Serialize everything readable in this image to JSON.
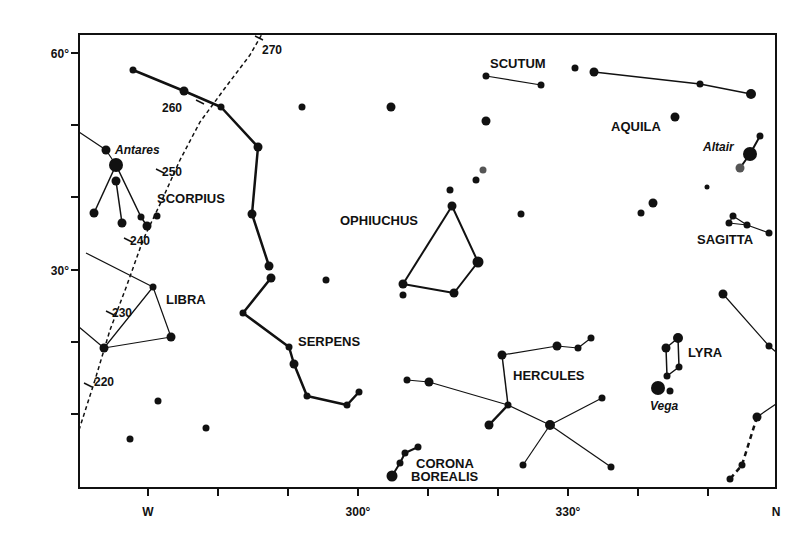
{
  "chart_data": {
    "type": "scatter",
    "title": "",
    "frame": {
      "x0": 79,
      "y0": 34,
      "x1": 776,
      "y1": 488
    },
    "y_axis": {
      "ticks": [
        {
          "y": 53,
          "label": "60°"
        },
        {
          "y": 125,
          "label": ""
        },
        {
          "y": 197,
          "label": ""
        },
        {
          "y": 270,
          "label": "30°"
        },
        {
          "y": 342,
          "label": ""
        },
        {
          "y": 414,
          "label": ""
        }
      ]
    },
    "x_axis": {
      "ticks": [
        {
          "x": 148,
          "label": "W"
        },
        {
          "x": 218,
          "label": ""
        },
        {
          "x": 288,
          "label": ""
        },
        {
          "x": 358,
          "label": "300°"
        },
        {
          "x": 428,
          "label": ""
        },
        {
          "x": 498,
          "label": ""
        },
        {
          "x": 568,
          "label": "330°"
        },
        {
          "x": 638,
          "label": ""
        },
        {
          "x": 708,
          "label": ""
        },
        {
          "x": 776,
          "label": "N"
        }
      ]
    },
    "ecliptic": {
      "style": "dashed",
      "path": [
        [
          79,
          430
        ],
        [
          95,
          380
        ],
        [
          110,
          330
        ],
        [
          127,
          285
        ],
        [
          143,
          240
        ],
        [
          162,
          200
        ],
        [
          180,
          160
        ],
        [
          200,
          122
        ],
        [
          225,
          88
        ],
        [
          250,
          55
        ],
        [
          262,
          34
        ]
      ],
      "marks": [
        {
          "label": "220",
          "x": 88,
          "y": 385,
          "lx": 94,
          "ly": 386
        },
        {
          "label": "230",
          "x": 110,
          "y": 313,
          "lx": 112,
          "ly": 317
        },
        {
          "label": "240",
          "x": 128,
          "y": 240,
          "lx": 130,
          "ly": 245
        },
        {
          "label": "250",
          "x": 160,
          "y": 171,
          "lx": 162,
          "ly": 176
        },
        {
          "label": "260",
          "x": 200,
          "y": 102,
          "lx": 162,
          "ly": 112
        },
        {
          "label": "270",
          "x": 259,
          "y": 38,
          "lx": 262,
          "ly": 54
        }
      ]
    },
    "constellation_labels": [
      {
        "text": "SCORPIUS",
        "x": 157,
        "y": 203
      },
      {
        "text": "LIBRA",
        "x": 166,
        "y": 304
      },
      {
        "text": "SERPENS",
        "x": 298,
        "y": 346
      },
      {
        "text": "OPHIUCHUS",
        "x": 340,
        "y": 225
      },
      {
        "text": "SCUTUM",
        "x": 490,
        "y": 68
      },
      {
        "text": "AQUILA",
        "x": 611,
        "y": 131
      },
      {
        "text": "SAGITTA",
        "x": 697,
        "y": 244
      },
      {
        "text": "HERCULES",
        "x": 513,
        "y": 380
      },
      {
        "text": "LYRA",
        "x": 688,
        "y": 357
      },
      {
        "text": "CORONA",
        "x": 416,
        "y": 468
      },
      {
        "text": "BOREALIS",
        "x": 411,
        "y": 481
      }
    ],
    "star_names": [
      {
        "text": "Antares",
        "x": 115,
        "y": 154
      },
      {
        "text": "Altair",
        "x": 703,
        "y": 151
      },
      {
        "text": "Vega",
        "x": 650,
        "y": 410
      }
    ],
    "stars": [
      {
        "x": 133,
        "y": 70,
        "r": 3.5
      },
      {
        "x": 184,
        "y": 91,
        "r": 4.5
      },
      {
        "x": 221,
        "y": 107,
        "r": 3.5
      },
      {
        "x": 258,
        "y": 147,
        "r": 4.5
      },
      {
        "x": 252,
        "y": 214,
        "r": 4.5
      },
      {
        "x": 269,
        "y": 266,
        "r": 4.5
      },
      {
        "x": 271,
        "y": 278,
        "r": 4.5
      },
      {
        "x": 243,
        "y": 313,
        "r": 3.5
      },
      {
        "x": 289,
        "y": 347,
        "r": 3.5
      },
      {
        "x": 294,
        "y": 364,
        "r": 4.5
      },
      {
        "x": 307,
        "y": 396,
        "r": 3.5
      },
      {
        "x": 347,
        "y": 405,
        "r": 3.5
      },
      {
        "x": 359,
        "y": 392,
        "r": 3.5
      },
      {
        "x": 302,
        "y": 107,
        "r": 3.5
      },
      {
        "x": 391,
        "y": 107,
        "r": 4.5
      },
      {
        "x": 486,
        "y": 76,
        "r": 3.5
      },
      {
        "x": 541,
        "y": 85,
        "r": 3.5
      },
      {
        "x": 486,
        "y": 121,
        "r": 4.5
      },
      {
        "x": 483,
        "y": 170,
        "r": 3.5,
        "gray": true
      },
      {
        "x": 476,
        "y": 180,
        "r": 3.5
      },
      {
        "x": 450,
        "y": 190,
        "r": 3.5
      },
      {
        "x": 452,
        "y": 206,
        "r": 4.5
      },
      {
        "x": 521,
        "y": 214,
        "r": 3.5
      },
      {
        "x": 478,
        "y": 262,
        "r": 5.5
      },
      {
        "x": 454,
        "y": 293,
        "r": 4.5
      },
      {
        "x": 403,
        "y": 284,
        "r": 4.5
      },
      {
        "x": 403,
        "y": 295,
        "r": 3.5
      },
      {
        "x": 326,
        "y": 280,
        "r": 3.5
      },
      {
        "x": 575,
        "y": 68,
        "r": 3.5
      },
      {
        "x": 594,
        "y": 72,
        "r": 4.5
      },
      {
        "x": 700,
        "y": 84,
        "r": 3.5
      },
      {
        "x": 751,
        "y": 94,
        "r": 5
      },
      {
        "x": 675,
        "y": 117,
        "r": 4.5
      },
      {
        "x": 760,
        "y": 136,
        "r": 3.5
      },
      {
        "x": 750,
        "y": 154,
        "r": 7
      },
      {
        "x": 740,
        "y": 168,
        "r": 4.5,
        "gray": true
      },
      {
        "x": 707,
        "y": 187,
        "r": 2.5
      },
      {
        "x": 653,
        "y": 203,
        "r": 4.5
      },
      {
        "x": 641,
        "y": 213,
        "r": 3.5
      },
      {
        "x": 733,
        "y": 216,
        "r": 3.5
      },
      {
        "x": 729,
        "y": 223,
        "r": 3.5
      },
      {
        "x": 747,
        "y": 225,
        "r": 3.5
      },
      {
        "x": 769,
        "y": 233,
        "r": 3.5
      },
      {
        "x": 106,
        "y": 150,
        "r": 4.5
      },
      {
        "x": 116,
        "y": 165,
        "r": 7
      },
      {
        "x": 116,
        "y": 181,
        "r": 4.5
      },
      {
        "x": 94,
        "y": 213,
        "r": 4.5
      },
      {
        "x": 122,
        "y": 223,
        "r": 4.5
      },
      {
        "x": 141,
        "y": 217,
        "r": 3.5
      },
      {
        "x": 147,
        "y": 226,
        "r": 4.5
      },
      {
        "x": 157,
        "y": 216,
        "r": 3.5
      },
      {
        "x": 153,
        "y": 287,
        "r": 3.5
      },
      {
        "x": 171,
        "y": 337,
        "r": 4.5
      },
      {
        "x": 104,
        "y": 348,
        "r": 4.5
      },
      {
        "x": 158,
        "y": 401,
        "r": 3.5
      },
      {
        "x": 130,
        "y": 439,
        "r": 3.5
      },
      {
        "x": 206,
        "y": 428,
        "r": 3.5
      },
      {
        "x": 502,
        "y": 355,
        "r": 4.5
      },
      {
        "x": 557,
        "y": 346,
        "r": 4.5
      },
      {
        "x": 578,
        "y": 348,
        "r": 3.5
      },
      {
        "x": 591,
        "y": 338,
        "r": 3.5
      },
      {
        "x": 407,
        "y": 380,
        "r": 3.5
      },
      {
        "x": 429,
        "y": 382,
        "r": 4.5
      },
      {
        "x": 508,
        "y": 405,
        "r": 3.5
      },
      {
        "x": 489,
        "y": 425,
        "r": 4.5
      },
      {
        "x": 550,
        "y": 425,
        "r": 5
      },
      {
        "x": 602,
        "y": 398,
        "r": 3.5
      },
      {
        "x": 523,
        "y": 465,
        "r": 3.5
      },
      {
        "x": 611,
        "y": 467,
        "r": 3.5
      },
      {
        "x": 392,
        "y": 476,
        "r": 5.5
      },
      {
        "x": 400,
        "y": 463,
        "r": 3.5
      },
      {
        "x": 405,
        "y": 453,
        "r": 3.5
      },
      {
        "x": 418,
        "y": 447,
        "r": 3.5
      },
      {
        "x": 666,
        "y": 348,
        "r": 4.5
      },
      {
        "x": 678,
        "y": 338,
        "r": 5
      },
      {
        "x": 679,
        "y": 367,
        "r": 3.5
      },
      {
        "x": 667,
        "y": 376,
        "r": 3.5
      },
      {
        "x": 658,
        "y": 388,
        "r": 7
      },
      {
        "x": 670,
        "y": 391,
        "r": 3.5
      },
      {
        "x": 723,
        "y": 294,
        "r": 4.5
      },
      {
        "x": 769,
        "y": 346,
        "r": 3.5
      },
      {
        "x": 757,
        "y": 417,
        "r": 4.5
      },
      {
        "x": 742,
        "y": 465,
        "r": 3.5
      },
      {
        "x": 730,
        "y": 479,
        "r": 3.5
      }
    ],
    "lines": [
      {
        "pts": [
          [
            133,
            70
          ],
          [
            184,
            91
          ],
          [
            221,
            107
          ],
          [
            258,
            147
          ],
          [
            252,
            214
          ],
          [
            269,
            266
          ]
        ],
        "w": 2.5
      },
      {
        "pts": [
          [
            271,
            278
          ],
          [
            243,
            313
          ],
          [
            289,
            347
          ],
          [
            294,
            364
          ],
          [
            307,
            396
          ],
          [
            347,
            405
          ],
          [
            359,
            392
          ]
        ],
        "w": 2.5
      },
      {
        "pts": [
          [
            486,
            76
          ],
          [
            541,
            85
          ]
        ],
        "w": 1.2
      },
      {
        "pts": [
          [
            594,
            72
          ],
          [
            700,
            84
          ],
          [
            751,
            94
          ]
        ],
        "w": 1.5
      },
      {
        "pts": [
          [
            760,
            136
          ],
          [
            750,
            154
          ],
          [
            740,
            168
          ]
        ],
        "w": 2
      },
      {
        "pts": [
          [
            729,
            223
          ],
          [
            733,
            216
          ],
          [
            747,
            225
          ],
          [
            769,
            233
          ]
        ],
        "w": 1.2
      },
      {
        "pts": [
          [
            729,
            223
          ],
          [
            747,
            225
          ]
        ],
        "w": 1.2
      },
      {
        "pts": [
          [
            452,
            206
          ],
          [
            403,
            284
          ]
        ],
        "w": 2
      },
      {
        "pts": [
          [
            452,
            206
          ],
          [
            478,
            262
          ],
          [
            454,
            293
          ],
          [
            403,
            284
          ]
        ],
        "w": 2
      },
      {
        "pts": [
          [
            79,
            132
          ],
          [
            106,
            150
          ],
          [
            116,
            165
          ]
        ],
        "w": 1.2
      },
      {
        "pts": [
          [
            116,
            165
          ],
          [
            94,
            213
          ]
        ],
        "w": 1.5
      },
      {
        "pts": [
          [
            116,
            181
          ],
          [
            122,
            223
          ]
        ],
        "w": 1.5
      },
      {
        "pts": [
          [
            116,
            165
          ],
          [
            141,
            217
          ],
          [
            147,
            226
          ]
        ],
        "w": 1.5
      },
      {
        "pts": [
          [
            86,
            253
          ],
          [
            153,
            287
          ],
          [
            171,
            337
          ],
          [
            104,
            348
          ],
          [
            153,
            287
          ]
        ],
        "w": 1.2
      },
      {
        "pts": [
          [
            79,
            327
          ],
          [
            104,
            348
          ]
        ],
        "w": 1.2
      },
      {
        "pts": [
          [
            502,
            355
          ],
          [
            557,
            346
          ],
          [
            578,
            348
          ],
          [
            591,
            338
          ]
        ],
        "w": 1.2
      },
      {
        "pts": [
          [
            502,
            355
          ],
          [
            508,
            405
          ]
        ],
        "w": 1.5
      },
      {
        "pts": [
          [
            407,
            380
          ],
          [
            429,
            382
          ],
          [
            508,
            405
          ],
          [
            550,
            425
          ],
          [
            602,
            398
          ]
        ],
        "w": 1.2
      },
      {
        "pts": [
          [
            508,
            405
          ],
          [
            489,
            425
          ]
        ],
        "w": 2.5
      },
      {
        "pts": [
          [
            550,
            425
          ],
          [
            523,
            465
          ]
        ],
        "w": 1.2
      },
      {
        "pts": [
          [
            550,
            425
          ],
          [
            611,
            467
          ]
        ],
        "w": 1.2
      },
      {
        "pts": [
          [
            392,
            476
          ],
          [
            400,
            463
          ],
          [
            405,
            453
          ],
          [
            418,
            447
          ]
        ],
        "w": 2
      },
      {
        "pts": [
          [
            666,
            348
          ],
          [
            667,
            376
          ],
          [
            679,
            367
          ],
          [
            678,
            338
          ],
          [
            666,
            348
          ]
        ],
        "w": 1.5
      },
      {
        "pts": [
          [
            723,
            294
          ],
          [
            769,
            346
          ],
          [
            776,
            352
          ]
        ],
        "w": 1.2
      },
      {
        "pts": [
          [
            757,
            417
          ],
          [
            776,
            404
          ]
        ],
        "w": 1.2
      },
      {
        "pts": [
          [
            757,
            417
          ],
          [
            742,
            465
          ],
          [
            730,
            479
          ]
        ],
        "w": 2.5,
        "dashed": true
      }
    ]
  }
}
